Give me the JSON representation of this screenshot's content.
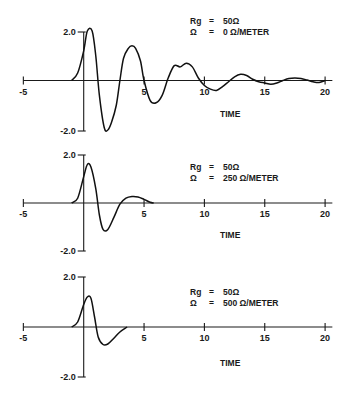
{
  "chart_data": [
    {
      "type": "line",
      "title": "",
      "xlabel": "TIME",
      "ylabel": "",
      "xlim": [
        -5,
        20
      ],
      "ylim": [
        -2.0,
        2.0
      ],
      "x_ticks": [
        "-5",
        "5",
        "10",
        "15",
        "20"
      ],
      "y_ticks": [
        "2.0",
        "-2.0"
      ],
      "grid": false,
      "annotation": [
        "Rg  =  50Ω",
        "Ω   =  0 Ω/METER"
      ],
      "series": [
        {
          "name": "Rg=50Ω, Ω=0 Ω/METER",
          "x": [
            -1.0,
            -0.5,
            0,
            0.3,
            0.7,
            1.0,
            1.3,
            1.7,
            2.0,
            2.3,
            2.7,
            3.0,
            3.3,
            3.7,
            4.0,
            4.3,
            4.7,
            5.0,
            5.5,
            6.0,
            6.5,
            7.0,
            7.5,
            8.0,
            8.5,
            9.0,
            9.5,
            10.0,
            10.5,
            11.0,
            11.5,
            12.0,
            12.5,
            13.0,
            13.5,
            14.0,
            14.5,
            15.0,
            15.5,
            16.0,
            16.5,
            17.0,
            17.5,
            18.0,
            18.5,
            19.0,
            19.5,
            20.0
          ],
          "y": [
            0.0,
            0.3,
            1.2,
            2.0,
            2.0,
            1.0,
            -0.6,
            -1.9,
            -2.0,
            -1.7,
            -1.0,
            0.0,
            0.9,
            1.3,
            1.4,
            1.3,
            0.8,
            0.0,
            -0.8,
            -0.9,
            -0.6,
            0.1,
            0.6,
            0.55,
            0.7,
            0.55,
            0.1,
            -0.2,
            -0.35,
            -0.4,
            -0.25,
            -0.05,
            0.15,
            0.25,
            0.2,
            0.05,
            -0.05,
            -0.1,
            -0.15,
            -0.1,
            0.0,
            0.08,
            0.1,
            0.08,
            0.02,
            -0.05,
            -0.08,
            0.0
          ]
        }
      ]
    },
    {
      "type": "line",
      "title": "",
      "xlabel": "TIME",
      "ylabel": "",
      "xlim": [
        -5,
        20
      ],
      "ylim": [
        -2.0,
        2.0
      ],
      "x_ticks": [
        "-5",
        "5",
        "10",
        "15",
        "20"
      ],
      "y_ticks": [
        "2.0",
        "-2.0"
      ],
      "grid": false,
      "annotation": [
        "Rg  =  50Ω",
        "Ω   =  250 Ω/METER"
      ],
      "series": [
        {
          "name": "Rg=50Ω, Ω=250 Ω/METER",
          "x": [
            -1.0,
            -0.5,
            0,
            0.3,
            0.6,
            1.0,
            1.3,
            1.6,
            2.0,
            2.5,
            3.0,
            3.5,
            4.0,
            4.5,
            5.0,
            5.5,
            5.8
          ],
          "y": [
            0.0,
            0.2,
            1.1,
            1.6,
            1.5,
            0.6,
            -0.5,
            -1.1,
            -1.1,
            -0.6,
            -0.05,
            0.2,
            0.27,
            0.25,
            0.15,
            0.03,
            0.0
          ]
        }
      ]
    },
    {
      "type": "line",
      "title": "",
      "xlabel": "TIME",
      "ylabel": "",
      "xlim": [
        -5,
        20
      ],
      "ylim": [
        -2.0,
        2.0
      ],
      "x_ticks": [
        "-5",
        "5",
        "10",
        "15",
        "20"
      ],
      "y_ticks": [
        "2.0",
        "-2.0"
      ],
      "grid": false,
      "annotation": [
        "Rg  =  50Ω",
        "Ω   =  500 Ω/METER"
      ],
      "series": [
        {
          "name": "Rg=50Ω, Ω=500 Ω/METER",
          "x": [
            -1.0,
            -0.5,
            0,
            0.3,
            0.6,
            0.9,
            1.2,
            1.6,
            2.0,
            2.5,
            3.0,
            3.6
          ],
          "y": [
            0.0,
            0.2,
            0.9,
            1.2,
            1.15,
            0.4,
            -0.4,
            -0.7,
            -0.68,
            -0.45,
            -0.2,
            0.0
          ]
        }
      ]
    }
  ],
  "panels": [
    {
      "rg_label": "Rg",
      "rg_eq": "=",
      "rg_value": "50Ω",
      "omega_label": "Ω",
      "omega_eq": "=",
      "omega_value": "0 Ω/METER",
      "xlabel": "TIME",
      "ytop": "2.0",
      "ybot": "-2.0"
    },
    {
      "rg_label": "Rg",
      "rg_eq": "=",
      "rg_value": "50Ω",
      "omega_label": "Ω",
      "omega_eq": "=",
      "omega_value": "250 Ω/METER",
      "xlabel": "TIME",
      "ytop": "2.0",
      "ybot": "-2.0"
    },
    {
      "rg_label": "Rg",
      "rg_eq": "=",
      "rg_value": "50Ω",
      "omega_label": "Ω",
      "omega_eq": "=",
      "omega_value": "500 Ω/METER",
      "xlabel": "TIME",
      "ytop": "2.0",
      "ybot": "-2.0"
    }
  ],
  "x_tick_labels": [
    "-5",
    "5",
    "10",
    "15",
    "20"
  ]
}
